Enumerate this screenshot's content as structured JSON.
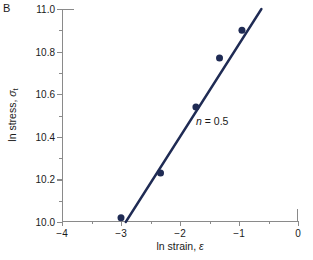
{
  "figure": {
    "panel_label": "B",
    "background_color": "#ffffff"
  },
  "colors": {
    "data": "#1f2b54",
    "axis": "#8a8a8a",
    "text": "#1a1a1a"
  },
  "annotation": {
    "exponent_symbol": "n",
    "equals": " = ",
    "exponent_value": "0.5",
    "full_text": "n = 0.5"
  },
  "axis_titles": {
    "x_prefix": "ln strain, ",
    "x_symbol": "ε",
    "y_prefix": "ln stress, ",
    "y_symbol": "σ",
    "y_subscript": "t"
  },
  "chart_data": {
    "type": "scatter",
    "title": "",
    "subtitle": "",
    "xlabel": "ln strain, ε",
    "ylabel": "ln stress, σt",
    "xlim": [
      -4,
      0
    ],
    "ylim": [
      10.0,
      11.0
    ],
    "xticks": [
      -4,
      -3,
      -2,
      -1,
      0
    ],
    "xticklabels": [
      "−4",
      "−3",
      "−2",
      "−1",
      "0"
    ],
    "xticks_minor": [
      -3.5,
      -2.5,
      -1.5,
      -0.5
    ],
    "yticks": [
      10.0,
      10.2,
      10.4,
      10.6,
      10.8,
      11.0
    ],
    "yticklabels": [
      "10.0",
      "10.2",
      "10.4",
      "10.6",
      "10.8",
      "11.0"
    ],
    "yticks_minor": [
      10.1,
      10.3,
      10.5,
      10.7,
      10.9
    ],
    "grid": false,
    "legend": null,
    "series": [
      {
        "name": "measured points",
        "type": "scatter",
        "marker": "circle",
        "marker_color": "#1f2b54",
        "marker_size": 7,
        "x": [
          -3.0,
          -2.33,
          -1.73,
          -1.33,
          -0.95
        ],
        "y": [
          10.02,
          10.23,
          10.54,
          10.77,
          10.9
        ]
      },
      {
        "name": "linear fit",
        "type": "line",
        "line_color": "#1f2b54",
        "line_width": 2.4,
        "slope": 0.435,
        "x": [
          -2.92,
          -0.62
        ],
        "y": [
          10.0,
          11.0
        ]
      }
    ],
    "annotations": [
      {
        "text": "n = 0.5",
        "x": -1.55,
        "y": 10.54,
        "italic_part": "n"
      }
    ]
  }
}
